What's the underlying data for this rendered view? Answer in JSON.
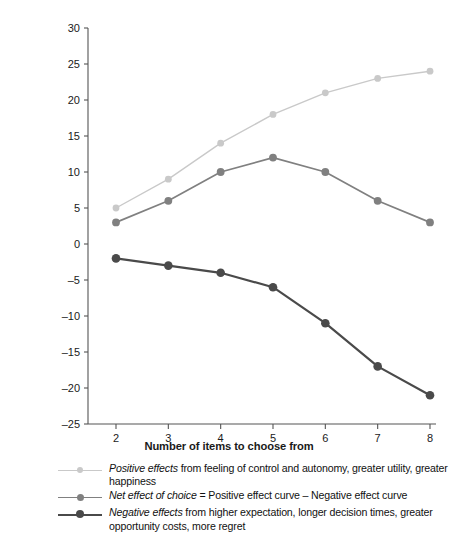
{
  "chart_data": {
    "type": "line",
    "title": "",
    "xlabel": "Number of items to choose from",
    "ylabel": "Cost, benefits, net choice satisfaction",
    "x": [
      2,
      3,
      4,
      5,
      6,
      7,
      8
    ],
    "xticklabels": [
      "2",
      "3",
      "4",
      "5",
      "6",
      "7",
      "8"
    ],
    "yticks": [
      -25,
      -20,
      -15,
      -10,
      -5,
      0,
      5,
      10,
      15,
      20,
      25,
      30
    ],
    "yticklabels": [
      "–25",
      "–20",
      "–15",
      "–10",
      "–5",
      "0",
      "5",
      "10",
      "15",
      "20",
      "25",
      "30"
    ],
    "xlim": [
      1.7,
      8.3
    ],
    "ylim": [
      -25,
      30
    ],
    "grid": false,
    "legend_position": "below",
    "series": [
      {
        "name": "Positive effects",
        "color": "#c9c9c9",
        "values": [
          5,
          9,
          14,
          18,
          21,
          23,
          24
        ]
      },
      {
        "name": "Net effect of choice",
        "color": "#808080",
        "values": [
          3,
          6,
          10,
          12,
          10,
          6,
          3
        ]
      },
      {
        "name": "Negative effects",
        "color": "#4a4a4a",
        "values": [
          -2,
          -3,
          -4,
          -6,
          -11,
          -17,
          -21
        ]
      }
    ]
  },
  "axis": {
    "ylabel": "Cost, benefits, net choice satisfaction",
    "xlabel": "Number of items to choose from"
  },
  "legend": {
    "items": [
      {
        "emphasis": "Positive effects",
        "rest": " from feeling of control and autonomy, greater utility, greater happiness",
        "color": "#c9c9c9",
        "line_width": 1.4,
        "dot_size": 6
      },
      {
        "emphasis": "Net effect of choice",
        "rest": " = Positive effect curve – Negative effect curve",
        "color": "#808080",
        "line_width": 1.7,
        "dot_size": 7
      },
      {
        "emphasis": "Negative effects",
        "rest": " from higher expectation, longer decision times, greater opportunity costs, more regret",
        "color": "#4a4a4a",
        "line_width": 2.2,
        "dot_size": 8
      }
    ]
  }
}
